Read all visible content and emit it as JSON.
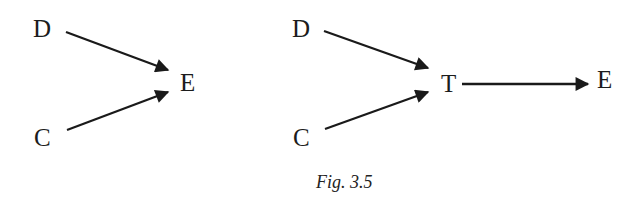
{
  "diagrams": [
    {
      "id": "left",
      "nodes": [
        {
          "label": "D",
          "x": 33,
          "y": 16
        },
        {
          "label": "E",
          "x": 180,
          "y": 70
        },
        {
          "label": "C",
          "x": 34,
          "y": 125
        }
      ],
      "edges": [
        {
          "from": "D",
          "to": "E"
        },
        {
          "from": "C",
          "to": "E"
        }
      ]
    },
    {
      "id": "right",
      "nodes": [
        {
          "label": "D",
          "x": 292,
          "y": 16
        },
        {
          "label": "T",
          "x": 441,
          "y": 71
        },
        {
          "label": "E",
          "x": 597,
          "y": 67
        },
        {
          "label": "C",
          "x": 293,
          "y": 125
        }
      ],
      "edges": [
        {
          "from": "D",
          "to": "T"
        },
        {
          "from": "C",
          "to": "T"
        },
        {
          "from": "T",
          "to": "E"
        }
      ]
    }
  ],
  "labels": {
    "left_d": "D",
    "left_e": "E",
    "left_c": "C",
    "right_d": "D",
    "right_t": "T",
    "right_e": "E",
    "right_c": "C",
    "caption": "Fig. 3.5"
  },
  "colors": {
    "stroke": "#1a1a1a",
    "background": "#ffffff"
  }
}
